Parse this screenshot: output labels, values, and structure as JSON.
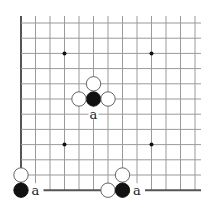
{
  "board": {
    "cols": 13,
    "rows": 12,
    "origin_x": 21,
    "origin_y": 23,
    "step_x": 14.5,
    "step_y": 15.2,
    "line_color": "#9a9a9a",
    "edge_color": "#555555",
    "star_points": [
      [
        3,
        2
      ],
      [
        9,
        2
      ],
      [
        3,
        8
      ],
      [
        9,
        8
      ]
    ]
  },
  "stones": [
    {
      "color": "black",
      "col": 5,
      "row": 5
    },
    {
      "color": "white",
      "col": 5,
      "row": 4
    },
    {
      "color": "white",
      "col": 4,
      "row": 5
    },
    {
      "color": "white",
      "col": 6,
      "row": 5
    },
    {
      "color": "white",
      "col": 0,
      "row": 10
    },
    {
      "color": "black",
      "col": 0,
      "row": 11
    },
    {
      "color": "white",
      "col": 7,
      "row": 10
    },
    {
      "color": "white",
      "col": 6,
      "row": 11
    },
    {
      "color": "black",
      "col": 7,
      "row": 11
    }
  ],
  "labels": [
    {
      "text": "a",
      "col": 5,
      "row": 6
    },
    {
      "text": "a",
      "col": 1,
      "row": 11
    },
    {
      "text": "a",
      "col": 8,
      "row": 11
    }
  ]
}
